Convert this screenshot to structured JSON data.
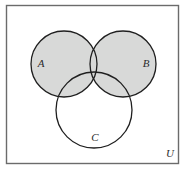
{
  "figure": {
    "kind": "venn-diagram",
    "title": "",
    "universe": {
      "label": "U",
      "shape": "rectangle",
      "border_color": "#6b6b6b",
      "fill_color": "#ffffff",
      "label_x": 170,
      "label_y": 157
    },
    "shaded_region": {
      "description": "A union B",
      "fill_color": "#d8d9d8"
    },
    "unshaded_region": {
      "description": "C minus (A union B)",
      "fill_color": "#ffffff"
    },
    "stroke_color": "#1f1f1f",
    "sets": [
      {
        "label": "A",
        "cx": 64,
        "cy": 64,
        "r": 33,
        "shaded": true,
        "label_x": 41,
        "label_y": 67
      },
      {
        "label": "B",
        "cx": 123,
        "cy": 64,
        "r": 33,
        "shaded": true,
        "label_x": 146,
        "label_y": 67
      },
      {
        "label": "C",
        "cx": 94,
        "cy": 110,
        "r": 38,
        "shaded": false,
        "label_x": 95,
        "label_y": 141
      }
    ]
  }
}
